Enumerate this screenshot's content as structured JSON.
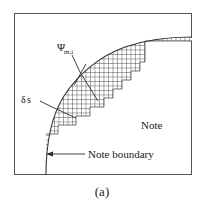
{
  "figure": {
    "caption": "(a)",
    "labels": {
      "psi_main": "Ψ",
      "psi_sub": "m,i",
      "delta_main": "δ",
      "delta_sub": "s",
      "region": "Note",
      "boundary": "Note boundary"
    },
    "icons": {
      "boundary_arrow": "arrow-left-icon",
      "psi_leader": "leader-line-icon",
      "delta_leader": "leader-line-icon"
    },
    "colors": {
      "frame": "#555555",
      "curve": "#333333",
      "mesh": "#3a3a3a",
      "text": "#1a1a1a",
      "background": "#ffffff"
    },
    "geometry": {
      "frame": {
        "x": 14,
        "y": 13,
        "width": 178,
        "height": 162
      },
      "mesh_cell_size": 4.5,
      "curve_exit_right_y": 42,
      "curve_exit_bottom_x": 46
    }
  }
}
